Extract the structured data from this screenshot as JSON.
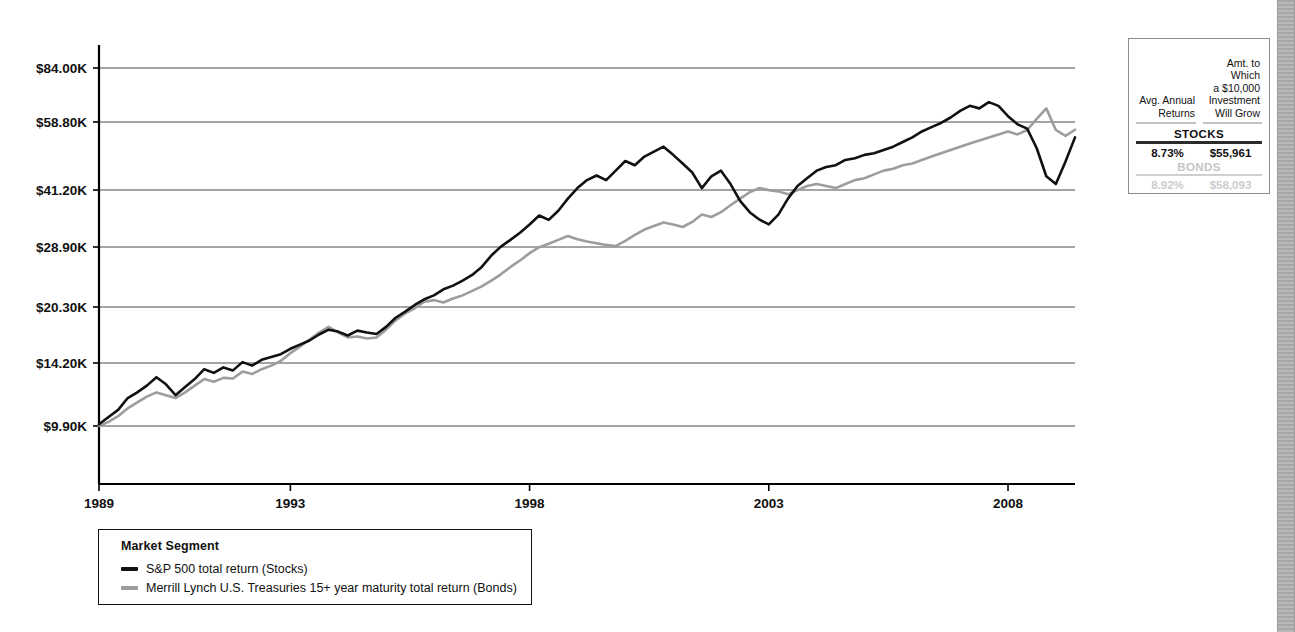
{
  "chart_data": {
    "type": "line",
    "title": "",
    "xlabel": "",
    "ylabel": "",
    "legend_title": "Market Segment",
    "legend_position": "below-left",
    "grid": "horizontal",
    "y_scale": "logarithmic",
    "y_tick_labels": [
      "$84.00K",
      "$58.80K",
      "$41.20K",
      "$28.90K",
      "$20.30K",
      "$14.20K",
      "$9.90K"
    ],
    "y_tick_values": [
      84000,
      58800,
      41200,
      28900,
      20300,
      14200,
      9900
    ],
    "ylim": [
      8000,
      95000
    ],
    "x_tick_labels": [
      "1989",
      "1993",
      "1998",
      "2003",
      "2008"
    ],
    "x_tick_values": [
      1989,
      1993,
      1998,
      2003,
      2008
    ],
    "xlim": [
      1989,
      2009.4
    ],
    "series": [
      {
        "name": "S&P 500 total return (Stocks)",
        "short_name": "Stocks",
        "color": "#111111",
        "x": [
          1989.0,
          1989.2,
          1989.4,
          1989.6,
          1989.8,
          1990.0,
          1990.2,
          1990.4,
          1990.6,
          1990.8,
          1991.0,
          1991.2,
          1991.4,
          1991.6,
          1991.8,
          1992.0,
          1992.2,
          1992.4,
          1992.6,
          1992.8,
          1993.0,
          1993.2,
          1993.4,
          1993.6,
          1993.8,
          1994.0,
          1994.2,
          1994.4,
          1994.6,
          1994.8,
          1995.0,
          1995.2,
          1995.4,
          1995.6,
          1995.8,
          1996.0,
          1996.2,
          1996.4,
          1996.6,
          1996.8,
          1997.0,
          1997.2,
          1997.4,
          1997.6,
          1997.8,
          1998.0,
          1998.2,
          1998.4,
          1998.6,
          1998.8,
          1999.0,
          1999.2,
          1999.4,
          1999.6,
          1999.8,
          2000.0,
          2000.2,
          2000.4,
          2000.6,
          2000.8,
          2001.0,
          2001.2,
          2001.4,
          2001.6,
          2001.8,
          2002.0,
          2002.2,
          2002.4,
          2002.6,
          2002.8,
          2003.0,
          2003.2,
          2003.4,
          2003.6,
          2003.8,
          2004.0,
          2004.2,
          2004.4,
          2004.6,
          2004.8,
          2005.0,
          2005.2,
          2005.4,
          2005.6,
          2005.8,
          2006.0,
          2006.2,
          2006.4,
          2006.6,
          2006.8,
          2007.0,
          2007.2,
          2007.4,
          2007.6,
          2007.8,
          2008.0,
          2008.2,
          2008.4,
          2008.6,
          2008.8,
          2009.0,
          2009.2,
          2009.4
        ],
        "y": [
          10000,
          10450,
          10900,
          11700,
          12100,
          12600,
          13250,
          12700,
          11900,
          12500,
          13100,
          13900,
          13600,
          14050,
          13800,
          14500,
          14200,
          14700,
          14950,
          15200,
          15700,
          16100,
          16500,
          17100,
          17600,
          17400,
          17000,
          17500,
          17300,
          17150,
          17900,
          18900,
          19600,
          20400,
          21100,
          21600,
          22400,
          22900,
          23600,
          24400,
          25600,
          27400,
          28900,
          30100,
          31400,
          33000,
          34800,
          33900,
          35800,
          38500,
          41000,
          43000,
          44200,
          43000,
          45500,
          48200,
          47000,
          49500,
          51000,
          52500,
          50000,
          47500,
          45000,
          41000,
          44000,
          45500,
          42000,
          38000,
          35500,
          34000,
          33000,
          35000,
          38500,
          41500,
          43500,
          45500,
          46500,
          47000,
          48500,
          49000,
          50000,
          50500,
          51500,
          52500,
          54000,
          55500,
          57500,
          59000,
          60500,
          62500,
          65000,
          67000,
          66000,
          68500,
          67000,
          63000,
          60000,
          58500,
          52000,
          44000,
          42000,
          48000,
          55500
        ]
      },
      {
        "name": "Merrill Lynch U.S. Treasuries 15+ year maturity total return (Bonds)",
        "short_name": "Bonds",
        "color": "#9d9d9d",
        "x": [
          1989.0,
          1989.2,
          1989.4,
          1989.6,
          1989.8,
          1990.0,
          1990.2,
          1990.4,
          1990.6,
          1990.8,
          1991.0,
          1991.2,
          1991.4,
          1991.6,
          1991.8,
          1992.0,
          1992.2,
          1992.4,
          1992.6,
          1992.8,
          1993.0,
          1993.2,
          1993.4,
          1993.6,
          1993.8,
          1994.0,
          1994.2,
          1994.4,
          1994.6,
          1994.8,
          1995.0,
          1995.2,
          1995.4,
          1995.6,
          1995.8,
          1996.0,
          1996.2,
          1996.4,
          1996.6,
          1996.8,
          1997.0,
          1997.2,
          1997.4,
          1997.6,
          1997.8,
          1998.0,
          1998.2,
          1998.4,
          1998.6,
          1998.8,
          1999.0,
          1999.2,
          1999.4,
          1999.6,
          1999.8,
          2000.0,
          2000.2,
          2000.4,
          2000.6,
          2000.8,
          2001.0,
          2001.2,
          2001.4,
          2001.6,
          2001.8,
          2002.0,
          2002.2,
          2002.4,
          2002.6,
          2002.8,
          2003.0,
          2003.2,
          2003.4,
          2003.6,
          2003.8,
          2004.0,
          2004.2,
          2004.4,
          2004.6,
          2004.8,
          2005.0,
          2005.2,
          2005.4,
          2005.6,
          2005.8,
          2006.0,
          2006.2,
          2006.4,
          2006.6,
          2006.8,
          2007.0,
          2007.2,
          2007.4,
          2007.6,
          2007.8,
          2008.0,
          2008.2,
          2008.4,
          2008.6,
          2008.8,
          2009.0,
          2009.2,
          2009.4
        ],
        "y": [
          9900,
          10150,
          10500,
          11000,
          11400,
          11800,
          12100,
          11900,
          11700,
          12100,
          12600,
          13100,
          12900,
          13200,
          13150,
          13700,
          13500,
          13900,
          14200,
          14600,
          15300,
          15900,
          16600,
          17300,
          17900,
          17300,
          16800,
          16900,
          16700,
          16800,
          17600,
          18600,
          19400,
          20000,
          20800,
          21000,
          20700,
          21200,
          21600,
          22200,
          22800,
          23600,
          24500,
          25600,
          26600,
          27800,
          28800,
          29400,
          30100,
          30800,
          30200,
          29800,
          29500,
          29200,
          29000,
          29900,
          31000,
          32000,
          32700,
          33400,
          33000,
          32500,
          33500,
          35000,
          34500,
          35500,
          37000,
          38500,
          40000,
          41000,
          40500,
          40200,
          39500,
          40500,
          41500,
          42000,
          41500,
          41000,
          42000,
          43000,
          43500,
          44500,
          45500,
          46000,
          47000,
          47500,
          48500,
          49500,
          50500,
          51500,
          52500,
          53500,
          54500,
          55500,
          56500,
          57500,
          56500,
          58000,
          62000,
          66000,
          58000,
          56000,
          58093
        ]
      }
    ]
  },
  "legend": {
    "title": "Market Segment",
    "items": [
      {
        "label": "S&P 500 total return (Stocks)",
        "color": "#111111"
      },
      {
        "label": "Merrill Lynch U.S. Treasuries 15+ year maturity total return (Bonds)",
        "color": "#9d9d9d"
      }
    ]
  },
  "summary_table": {
    "header_col1": "Avg. Annual\nReturns",
    "header_col1_line1": "Avg. Annual",
    "header_col1_line2": "Returns",
    "header_col2_line1": "Amt. to Which",
    "header_col2_line2": "a $10,000",
    "header_col2_line3": "Investment",
    "header_col2_line4": "Will Grow",
    "rows": [
      {
        "band_label": "STOCKS",
        "avg_annual_return": "8.73%",
        "growth_amount": "$55,961",
        "state": "active"
      },
      {
        "band_label": "BONDS",
        "avg_annual_return": "8.92%",
        "growth_amount": "$58,093",
        "state": "dimmed"
      }
    ]
  }
}
